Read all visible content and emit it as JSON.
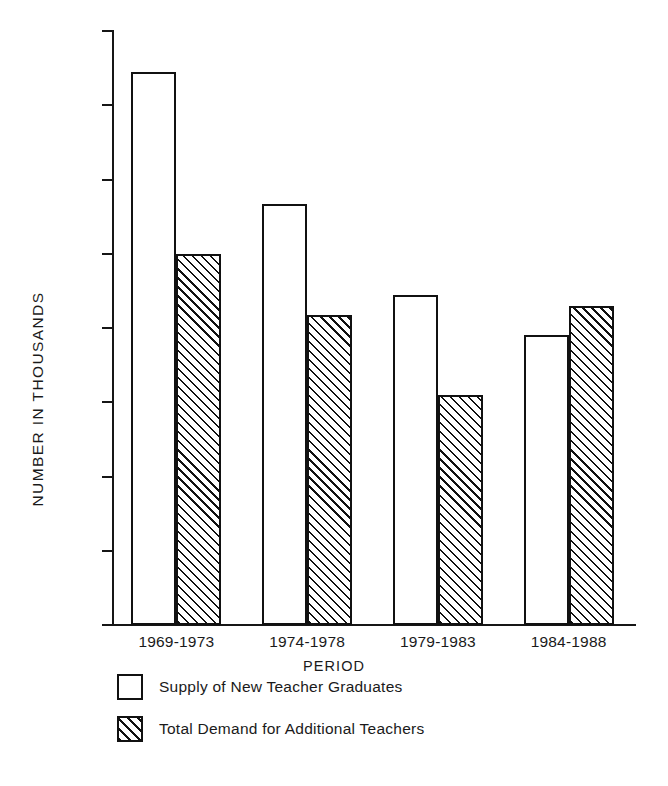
{
  "chart_data": {
    "type": "bar",
    "title": "",
    "xlabel": "PERIOD",
    "ylabel": "NUMBER IN THOUSANDS",
    "categories": [
      "1969-1973",
      "1974-1978",
      "1979-1983",
      "1984-1988"
    ],
    "series": [
      {
        "name": "Supply of New Teacher Graduates",
        "style": "open",
        "values": [
          1490,
          1135,
          890,
          780
        ]
      },
      {
        "name": "Total Demand for Additional Teachers",
        "style": "hatched",
        "values": [
          1000,
          835,
          620,
          860
        ]
      }
    ],
    "ylim": [
      0,
      1600
    ],
    "yticks": [
      0,
      200,
      400,
      600,
      800,
      1000,
      1200,
      1400,
      1600
    ],
    "ytick_labels": [
      "0",
      "200",
      "400",
      "600",
      "800",
      "1,000",
      "1,200",
      "1,400",
      "1,600"
    ],
    "grid": false,
    "legend_position": "bottom-left",
    "colors": {
      "ink": "#111111",
      "background": "#ffffff"
    }
  },
  "legend": {
    "items": [
      {
        "label": "Supply of New Teacher Graduates",
        "style": "open"
      },
      {
        "label": "Total Demand for Additional Teachers",
        "style": "hatched"
      }
    ]
  }
}
